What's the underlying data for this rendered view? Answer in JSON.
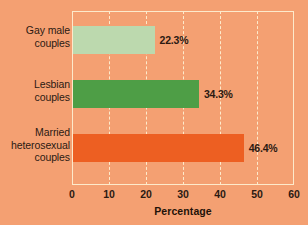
{
  "chart_data": {
    "type": "bar",
    "orientation": "horizontal",
    "title": "",
    "subtitle": "",
    "xlabel": "Percentage",
    "ylabel": "",
    "categories": [
      "Gay male\ncouples",
      "Lesbian\ncouples",
      "Married\nheterosexual\ncouples"
    ],
    "values": [
      22.3,
      34.3,
      46.4
    ],
    "value_labels": [
      "22.3%",
      "34.3%",
      "46.4%"
    ],
    "bar_colors": [
      "#bcd9ae",
      "#4e9e46",
      "#ed5f22"
    ],
    "xlim": [
      0,
      60
    ],
    "xticks": [
      0,
      10,
      20,
      30,
      40,
      50,
      60
    ],
    "xtick_labels": [
      "0",
      "10",
      "20",
      "30",
      "40",
      "50",
      "60"
    ],
    "grid": true,
    "grid_axis": "x",
    "grid_style": "dashed",
    "grid_color": "#fdeacb",
    "legend": false,
    "background_color": "#f4a072",
    "frame_color": "#fdeacb",
    "text_color": "#2b1a12"
  }
}
